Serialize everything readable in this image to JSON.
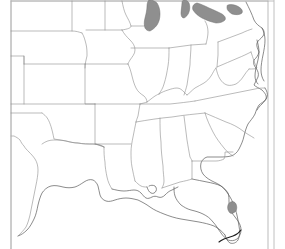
{
  "figure": {
    "kind": "blank-outline-map",
    "region": "Eastern and Central United States",
    "background_color": "#ffffff",
    "border_color": "#8d8d8d",
    "coastline_color": "#5a5a5a",
    "lake_fill_color": "#8f8f8f",
    "land_fill_color": "#ffffff",
    "frame_color": "#b9b9b9",
    "has_labels": false,
    "label_text": "",
    "width_px": 285,
    "height_px": 249
  },
  "frame": {
    "left_rule_x": 11,
    "right_rule_x": 274,
    "visible": true
  },
  "features": {
    "water_bodies": [
      {
        "name": "Lake Michigan",
        "fill": "#8f8f8f"
      },
      {
        "name": "Lake Huron",
        "fill": "#8f8f8f"
      },
      {
        "name": "Lake Erie",
        "fill": "#8f8f8f"
      },
      {
        "name": "Lake Okeechobee",
        "fill": "#8f8f8f"
      }
    ],
    "states_depicted": [
      "Wyoming",
      "Nebraska",
      "Colorado",
      "Kansas",
      "Oklahoma",
      "Texas",
      "Minnesota",
      "Iowa",
      "Missouri",
      "Arkansas",
      "Louisiana",
      "Wisconsin",
      "Illinois",
      "Mississippi",
      "Alabama",
      "Tennessee",
      "Kentucky",
      "Indiana",
      "Michigan",
      "Ohio",
      "West Virginia",
      "Virginia",
      "North Carolina",
      "South Carolina",
      "Georgia",
      "Florida",
      "Pennsylvania",
      "Maryland",
      "Delaware",
      "New Jersey",
      "New York"
    ],
    "coastlines": [
      "Atlantic Coast",
      "Gulf of Mexico Coast",
      "Florida Keys"
    ]
  }
}
